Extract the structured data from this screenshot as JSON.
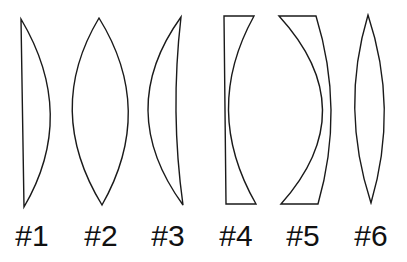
{
  "diagram": {
    "type": "lens-shapes",
    "stroke_color": "#1a1a1a",
    "background": "#ffffff",
    "lenses": [
      {
        "id": 1,
        "label": "#1",
        "shape": "plano-convex"
      },
      {
        "id": 2,
        "label": "#2",
        "shape": "biconvex"
      },
      {
        "id": 3,
        "label": "#3",
        "shape": "positive-meniscus"
      },
      {
        "id": 4,
        "label": "#4",
        "shape": "plano-concave"
      },
      {
        "id": 5,
        "label": "#5",
        "shape": "negative-meniscus"
      },
      {
        "id": 6,
        "label": "#6",
        "shape": "biconvex-thin"
      }
    ]
  }
}
